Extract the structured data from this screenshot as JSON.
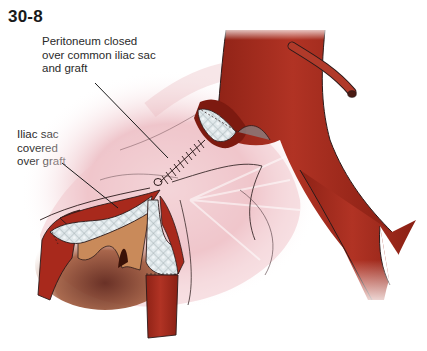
{
  "figure": {
    "number": "30-8",
    "callouts": [
      {
        "id": "peritoneum",
        "lines": [
          "Peritoneum closed",
          "over common iliac sac",
          "and graft"
        ],
        "leader_from": [
          95,
          83
        ],
        "leader_to": [
          168,
          158
        ]
      },
      {
        "id": "iliac-sac",
        "lines": [
          "Iliac sac",
          "covered",
          "over graft"
        ],
        "leader_from": [
          62,
          163
        ],
        "leader_to": [
          118,
          208
        ]
      }
    ],
    "structures": [
      "aorta",
      "inferior-mesenteric-artery-stump",
      "common-iliac-artery",
      "external-iliac-artery",
      "internal-iliac-artery",
      "peritoneum",
      "iliac-sac",
      "woven-graft",
      "suture-line"
    ],
    "colors": {
      "artery": "#a8291c",
      "artery_dark": "#7d1a10",
      "artery_light": "#c85a48",
      "peritoneum": "#f0c8cc",
      "graft": "#d9e2e6",
      "sac_interior": "#c98a5a",
      "outline": "#2b1a1a"
    }
  }
}
